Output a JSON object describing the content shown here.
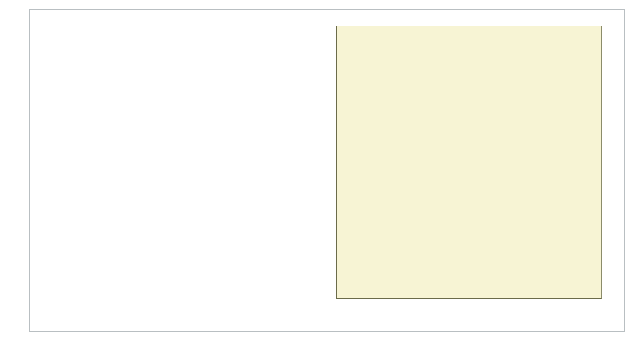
{
  "chart_data": {
    "type": "bar",
    "orientation": "horizontal",
    "title": "",
    "subtitle": "",
    "xlabel": "",
    "ylabel": "",
    "xlim": [
      0,
      90
    ],
    "xticks": [
      0,
      10,
      20,
      30,
      40,
      50,
      60,
      70,
      80,
      90
    ],
    "grid": true,
    "legend": "none",
    "style": "3d",
    "colors": {
      "bar_face": "#8e81c8",
      "bar_top": "#a79adb",
      "bar_side": "#6d5fae",
      "bar_outline": "#4b3f87",
      "plot_background": "#f7f4d4",
      "wall_side": "#ded8b4",
      "floor": "#e8e3c0",
      "gridline": "#8f8f6d",
      "frame": "#b9bfc2",
      "text": "#1a1a1a",
      "page_background": "#ffffff"
    },
    "categories": [
      "The problems in our country can be resolved with the participation of all (agree)",
      "Democracy is preferable to any other form of government (agree)",
      "Democracy can exist without political parties (disagree)",
      "Democracy has some problems, but it is the best form of government (agree)",
      "The people should govern directly, not through elected representatives (disagree)",
      "For our country to progress, our presidents need to limit the voice and vote of opposition parties (disagree)",
      "Justifiable for president to shut and govern without the Supreme Court when the country is facing hard times (disagree)",
      "Justifiable for president to shut and govern without Congress when the country is facing hard times (disagree)"
    ],
    "category_lines": [
      [
        "The problems in our country can be resolved",
        "with the participation of all (agree)"
      ],
      [
        "Democracy is preferable to any other",
        "form of government (agree)"
      ],
      [
        "Democracy can exist without",
        "political parties (disagree)"
      ],
      [
        "Democracy has some problems, but it is",
        "the best form of government (agree)"
      ],
      [
        "The people should govern directly, not through",
        "elected representatives (disagree)"
      ],
      [
        "For our country to progress, our presidents need to limit",
        "the voice and vote of opposition parties (disagree)"
      ],
      [
        "Justifiable for president to shut and govern without the Supreme",
        "Court when the country is facing hard times (disagree)"
      ],
      [
        "Justifiable for president to shut and govern without",
        "Congress when the country is facing hard times (disagree)"
      ]
    ],
    "values": [
      65,
      65,
      46,
      68,
      61,
      51,
      85,
      85
    ]
  }
}
